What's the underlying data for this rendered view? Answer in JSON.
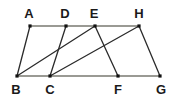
{
  "figure": {
    "name": "geometry-figure",
    "type": "line-diagram",
    "background_color": "#ffffff",
    "width": 178,
    "height": 98,
    "colors": {
      "horizontal_line": "#7a7a72",
      "diagonal_line": "#2b2b2b",
      "vertex_dot": "#111111",
      "label_text": "#1a1a1a"
    },
    "points": [
      {
        "id": "A",
        "label": "A",
        "x": 30,
        "y": 26,
        "label_x": 29,
        "label_y": 18,
        "row": "top"
      },
      {
        "id": "D",
        "label": "D",
        "x": 66,
        "y": 26,
        "label_x": 65,
        "label_y": 18,
        "row": "top"
      },
      {
        "id": "E",
        "label": "E",
        "x": 95,
        "y": 26,
        "label_x": 94,
        "label_y": 18,
        "row": "top"
      },
      {
        "id": "H",
        "label": "H",
        "x": 139,
        "y": 26,
        "label_x": 139,
        "label_y": 18,
        "row": "top"
      },
      {
        "id": "B",
        "label": "B",
        "x": 17,
        "y": 76,
        "label_x": 16,
        "label_y": 94,
        "row": "bottom"
      },
      {
        "id": "C",
        "label": "C",
        "x": 50,
        "y": 76,
        "label_x": 50,
        "label_y": 94,
        "row": "bottom"
      },
      {
        "id": "F",
        "label": "F",
        "x": 118,
        "y": 76,
        "label_x": 118,
        "label_y": 94,
        "row": "bottom"
      },
      {
        "id": "G",
        "label": "G",
        "x": 160,
        "y": 76,
        "label_x": 161,
        "label_y": 94,
        "row": "bottom"
      }
    ],
    "segments": [
      {
        "id": "AH",
        "from": "A",
        "to": "H",
        "style": "horizontal",
        "x1": 30,
        "y1": 26,
        "x2": 139,
        "y2": 26
      },
      {
        "id": "BG",
        "from": "B",
        "to": "G",
        "style": "horizontal",
        "x1": 17,
        "y1": 76,
        "x2": 160,
        "y2": 76
      },
      {
        "id": "AB",
        "from": "A",
        "to": "B",
        "style": "diagonal",
        "x1": 30,
        "y1": 26,
        "x2": 17,
        "y2": 76
      },
      {
        "id": "BE",
        "from": "B",
        "to": "E",
        "style": "diagonal",
        "x1": 17,
        "y1": 76,
        "x2": 95,
        "y2": 26
      },
      {
        "id": "CD",
        "from": "C",
        "to": "D",
        "style": "diagonal",
        "x1": 50,
        "y1": 76,
        "x2": 66,
        "y2": 26
      },
      {
        "id": "CH",
        "from": "C",
        "to": "H",
        "style": "diagonal",
        "x1": 50,
        "y1": 76,
        "x2": 139,
        "y2": 26
      },
      {
        "id": "EF",
        "from": "E",
        "to": "F",
        "style": "diagonal",
        "x1": 95,
        "y1": 26,
        "x2": 118,
        "y2": 76
      },
      {
        "id": "HG",
        "from": "H",
        "to": "G",
        "style": "diagonal",
        "x1": 139,
        "y1": 26,
        "x2": 160,
        "y2": 76
      }
    ]
  }
}
